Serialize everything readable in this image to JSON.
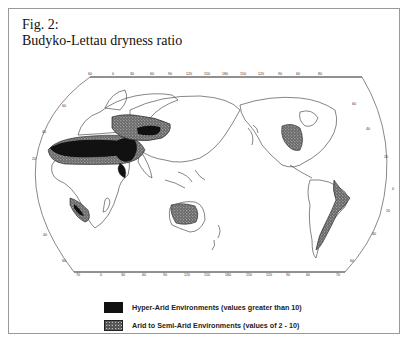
{
  "figure": {
    "label": "Fig. 2:",
    "title": "Budyko-Lettau dryness ratio"
  },
  "map": {
    "projection": "world map (oval projection, Pacific/Asia centered)",
    "top_longitude_ticks": [
      "60",
      "0",
      "30",
      "60",
      "90",
      "120",
      "150",
      "180",
      "150",
      "120",
      "90",
      "60",
      "80"
    ],
    "bottom_longitude_ticks": [
      "70",
      "0",
      "30",
      "60",
      "90",
      "120",
      "150",
      "180",
      "150",
      "120",
      "90",
      "60",
      "70"
    ],
    "left_latitude_ticks": [
      "60",
      "40",
      "20",
      "0",
      "20",
      "40",
      "60"
    ],
    "right_latitude_ticks": [
      "60",
      "40",
      "20",
      "0",
      "20",
      "40",
      "60"
    ],
    "regions": [
      {
        "name": "Sahara / Arabia",
        "class": "hyper-arid"
      },
      {
        "name": "Central Asia / Gobi",
        "class": "hyper-arid"
      },
      {
        "name": "Southern Africa (Namib/Kalahari)",
        "class": "arid-semi-arid"
      },
      {
        "name": "Australia interior",
        "class": "arid-semi-arid"
      },
      {
        "name": "Southwest North America",
        "class": "arid-semi-arid"
      },
      {
        "name": "Western South America (Atacama/Patagonia)",
        "class": "arid-semi-arid"
      }
    ],
    "colors": {
      "hyper_arid": "#111111",
      "arid": "#555555",
      "outline": "#333333",
      "frame": "#9a9a9a"
    }
  },
  "legend": {
    "items": [
      {
        "swatch": "hyper-arid",
        "label": "Hyper-Arid Environments (values greater than 10)"
      },
      {
        "swatch": "arid-semi-arid",
        "label": "Arid to Semi-Arid Environments (values of 2 - 10)"
      }
    ]
  }
}
